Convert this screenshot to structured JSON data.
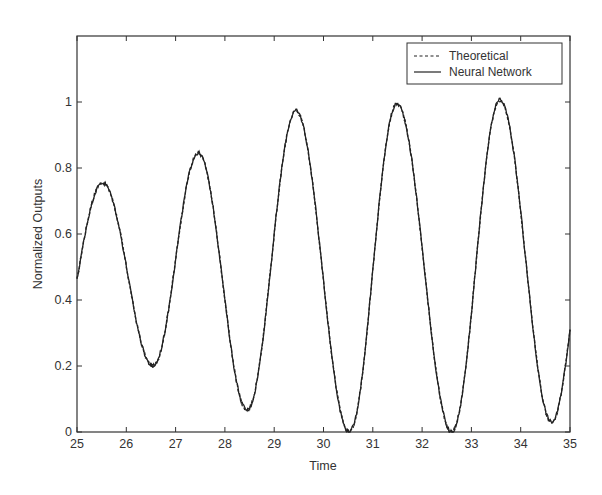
{
  "chart_data": {
    "type": "line",
    "title": "",
    "xlabel": "Time",
    "ylabel": "Normalized Outputs",
    "xlim": [
      25,
      35
    ],
    "ylim": [
      0,
      1.2
    ],
    "xticks": [
      25,
      26,
      27,
      28,
      29,
      30,
      31,
      32,
      33,
      34,
      35
    ],
    "xtick_labels": [
      "25",
      "26",
      "27",
      "28",
      "29",
      "30",
      "31",
      "32",
      "33",
      "34",
      "35"
    ],
    "yticks": [
      0,
      0.2,
      0.4,
      0.6,
      0.8,
      1
    ],
    "ytick_labels": [
      "0",
      "0.2",
      "0.4",
      "0.6",
      "0.8",
      "1"
    ],
    "grid": false,
    "legend_position": "upper right",
    "series": [
      {
        "name": "Theoretical",
        "style": "dashed",
        "color": "#222222",
        "x": [
          25.0,
          25.52,
          26.54,
          27.46,
          28.45,
          29.44,
          30.52,
          31.49,
          32.6,
          33.58,
          34.63,
          35.0
        ],
        "y": [
          0.46,
          0.755,
          0.2,
          0.845,
          0.067,
          0.973,
          0.0,
          0.994,
          0.0,
          1.006,
          0.03,
          0.31
        ]
      },
      {
        "name": "Neural Network",
        "style": "solid",
        "color": "#222222",
        "x": [
          25.0,
          25.52,
          26.54,
          27.46,
          28.45,
          29.44,
          30.52,
          31.49,
          32.6,
          33.58,
          34.63,
          35.0
        ],
        "y": [
          0.46,
          0.755,
          0.2,
          0.845,
          0.067,
          0.973,
          0.0,
          0.994,
          0.0,
          1.006,
          0.03,
          0.31
        ]
      }
    ]
  },
  "legend": {
    "items": [
      {
        "label": "Theoretical",
        "style": "dashed"
      },
      {
        "label": "Neural Network",
        "style": "solid"
      }
    ]
  }
}
